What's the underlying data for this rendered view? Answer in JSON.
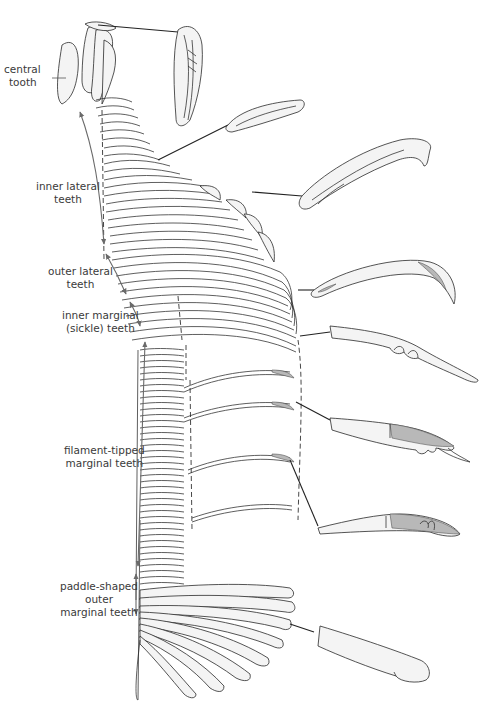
{
  "figure": {
    "labels": [
      {
        "id": "central",
        "lines": [
          "central",
          "tooth"
        ]
      },
      {
        "id": "inner_lateral",
        "lines": [
          "inner lateral",
          "teeth"
        ]
      },
      {
        "id": "outer_lateral",
        "lines": [
          "outer lateral",
          "teeth"
        ]
      },
      {
        "id": "inner_marginal",
        "lines": [
          "inner marginal",
          "(sickle) teeth"
        ]
      },
      {
        "id": "filament_tipped",
        "lines": [
          "filament-tipped",
          "marginal teeth"
        ]
      },
      {
        "id": "paddle_shaped",
        "lines": [
          "paddle-shaped",
          "outer",
          "marginal teeth"
        ]
      }
    ],
    "colors": {
      "line": "#2a2a2a",
      "tooth_fill": "#f4f4f4",
      "arrow": "#6a6a6a",
      "filament_shade": "#b8b8b8",
      "label_text": "#3a3a3a"
    }
  }
}
